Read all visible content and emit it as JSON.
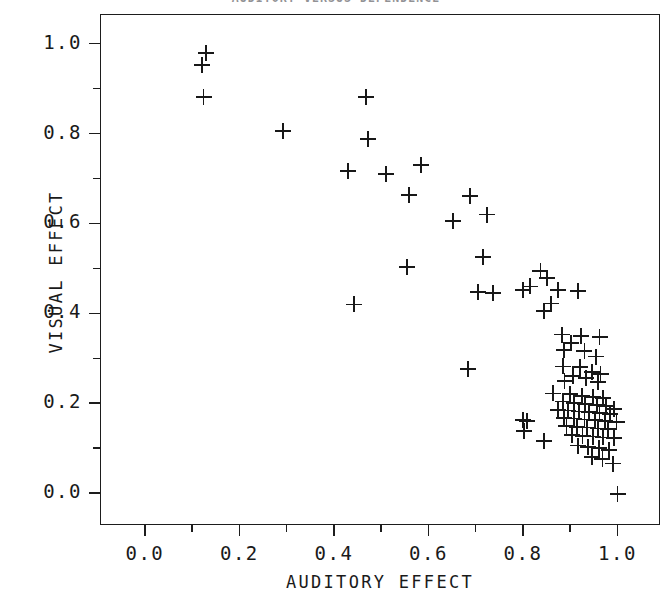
{
  "figure": {
    "title": "AUDITORY VERSUS DEPENDENCE",
    "title_clipped": true,
    "background_color": "#ffffff",
    "foreground_color": "#181818"
  },
  "axes": {
    "x": {
      "label": "AUDITORY EFFECT",
      "tick_labels": [
        "0.0",
        "0.2",
        "0.4",
        "0.6",
        "0.8",
        "1.0"
      ],
      "tick_values": [
        0.0,
        0.2,
        0.4,
        0.6,
        0.8,
        1.0
      ],
      "minor_tick_values": [
        0.1,
        0.3,
        0.5,
        0.7,
        0.9
      ],
      "limits": [
        -0.095,
        1.09
      ]
    },
    "y": {
      "label": "VISUAL EFFECT",
      "tick_labels": [
        "0.0",
        "0.2",
        "0.4",
        "0.6",
        "0.8",
        "1.0"
      ],
      "tick_values": [
        0.0,
        0.2,
        0.4,
        0.6,
        0.8,
        1.0
      ],
      "minor_tick_values": [
        0.1,
        0.3,
        0.5,
        0.7,
        0.9
      ],
      "limits": [
        -0.071,
        1.066
      ]
    }
  },
  "chart_data": {
    "type": "scatter",
    "title": "AUDITORY VERSUS DEPENDENCE",
    "xlabel": "AUDITORY EFFECT",
    "ylabel": "VISUAL EFFECT",
    "xlim": [
      -0.095,
      1.09
    ],
    "ylim": [
      -0.071,
      1.066
    ],
    "xticks": [
      0.0,
      0.2,
      0.4,
      0.6,
      0.8,
      1.0
    ],
    "yticks": [
      0.0,
      0.2,
      0.4,
      0.6,
      0.8,
      1.0
    ],
    "grid": false,
    "legend": null,
    "marker": "plus",
    "marker_color": "#181818",
    "n_points": 88,
    "points": [
      [
        0.128,
        0.982
      ],
      [
        0.118,
        0.955
      ],
      [
        0.122,
        0.884
      ],
      [
        0.29,
        0.808
      ],
      [
        0.466,
        0.884
      ],
      [
        0.47,
        0.79
      ],
      [
        0.428,
        0.719
      ],
      [
        0.508,
        0.712
      ],
      [
        0.582,
        0.732
      ],
      [
        0.556,
        0.665
      ],
      [
        0.685,
        0.663
      ],
      [
        0.722,
        0.622
      ],
      [
        0.65,
        0.607
      ],
      [
        0.714,
        0.527
      ],
      [
        0.552,
        0.506
      ],
      [
        0.835,
        0.496
      ],
      [
        0.848,
        0.48
      ],
      [
        0.872,
        0.455
      ],
      [
        0.914,
        0.452
      ],
      [
        0.702,
        0.45
      ],
      [
        0.734,
        0.447
      ],
      [
        0.798,
        0.455
      ],
      [
        0.812,
        0.462
      ],
      [
        0.858,
        0.424
      ],
      [
        0.842,
        0.408
      ],
      [
        0.44,
        0.422
      ],
      [
        0.88,
        0.355
      ],
      [
        0.92,
        0.352
      ],
      [
        0.96,
        0.35
      ],
      [
        0.9,
        0.336
      ],
      [
        0.884,
        0.32
      ],
      [
        0.928,
        0.318
      ],
      [
        0.952,
        0.306
      ],
      [
        0.882,
        0.284
      ],
      [
        0.918,
        0.282
      ],
      [
        0.944,
        0.272
      ],
      [
        0.962,
        0.268
      ],
      [
        0.904,
        0.262
      ],
      [
        0.932,
        0.258
      ],
      [
        0.886,
        0.252
      ],
      [
        0.956,
        0.25
      ],
      [
        0.682,
        0.278
      ],
      [
        0.798,
        0.165
      ],
      [
        0.806,
        0.162
      ],
      [
        0.8,
        0.14
      ],
      [
        0.862,
        0.224
      ],
      [
        0.898,
        0.222
      ],
      [
        0.922,
        0.218
      ],
      [
        0.946,
        0.216
      ],
      [
        0.968,
        0.214
      ],
      [
        0.99,
        0.19
      ],
      [
        0.882,
        0.206
      ],
      [
        0.906,
        0.202
      ],
      [
        0.93,
        0.2
      ],
      [
        0.954,
        0.198
      ],
      [
        0.974,
        0.196
      ],
      [
        0.872,
        0.188
      ],
      [
        0.894,
        0.186
      ],
      [
        0.916,
        0.184
      ],
      [
        0.938,
        0.182
      ],
      [
        0.96,
        0.18
      ],
      [
        0.982,
        0.178
      ],
      [
        0.884,
        0.17
      ],
      [
        0.906,
        0.168
      ],
      [
        0.928,
        0.166
      ],
      [
        0.95,
        0.164
      ],
      [
        0.972,
        0.162
      ],
      [
        0.996,
        0.16
      ],
      [
        0.89,
        0.152
      ],
      [
        0.912,
        0.15
      ],
      [
        0.934,
        0.148
      ],
      [
        0.956,
        0.146
      ],
      [
        0.978,
        0.144
      ],
      [
        0.902,
        0.132
      ],
      [
        0.924,
        0.13
      ],
      [
        0.946,
        0.128
      ],
      [
        0.968,
        0.126
      ],
      [
        0.99,
        0.124
      ],
      [
        0.842,
        0.118
      ],
      [
        0.914,
        0.108
      ],
      [
        0.936,
        0.105
      ],
      [
        0.958,
        0.102
      ],
      [
        0.98,
        0.099
      ],
      [
        0.944,
        0.082
      ],
      [
        0.966,
        0.078
      ],
      [
        0.988,
        0.068
      ],
      [
        0.998,
        0.0
      ]
    ]
  }
}
